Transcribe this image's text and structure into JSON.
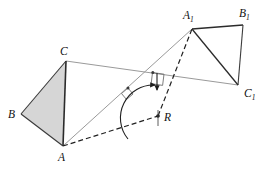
{
  "figure": {
    "background_color": "#ffffff",
    "line_color_dark": "#2b2b2b",
    "line_color_gray": "#8c8c8c",
    "fill_color_shaded": "#d4d4d4",
    "dash_color": "#1f1f1f",
    "labels": {
      "B": "B",
      "C": "C",
      "A": "A",
      "R": "R",
      "A1_base": "A",
      "A1_sub": "1",
      "B1_base": "B",
      "B1_sub": "1",
      "C1_base": "C",
      "C1_sub": "1"
    },
    "points": {
      "A": {
        "x": 63,
        "y": 146
      },
      "B": {
        "x": 21,
        "y": 114
      },
      "C": {
        "x": 66,
        "y": 61
      },
      "A1": {
        "x": 192,
        "y": 29
      },
      "B1": {
        "x": 243,
        "y": 25
      },
      "C1": {
        "x": 238,
        "y": 85
      },
      "R": {
        "x": 158,
        "y": 116
      },
      "mid_AA1": {
        "x": 128,
        "y": 88
      },
      "mid_CC1": {
        "x": 153,
        "y": 73
      }
    },
    "label_positions": {
      "A": {
        "x": 58,
        "y": 161
      },
      "B": {
        "x": 8,
        "y": 118
      },
      "C": {
        "x": 60,
        "y": 55
      },
      "R": {
        "x": 164,
        "y": 121
      },
      "A1": {
        "x": 183,
        "y": 19
      },
      "B1": {
        "x": 239,
        "y": 17
      },
      "C1": {
        "x": 244,
        "y": 97
      }
    },
    "segments": [
      {
        "name": "segment-B-C",
        "from": "B",
        "to": "C",
        "style": "solid-dark"
      },
      {
        "name": "segment-C-A",
        "from": "C",
        "to": "A",
        "style": "solid-dark"
      },
      {
        "name": "segment-A-B",
        "from": "A",
        "to": "B",
        "style": "solid-dark"
      },
      {
        "name": "segment-A1-B1",
        "from": "A1",
        "to": "B1",
        "style": "solid-dark"
      },
      {
        "name": "segment-B1-C1",
        "from": "B1",
        "to": "C1",
        "style": "solid-dark"
      },
      {
        "name": "segment-C1-A1",
        "from": "C1",
        "to": "A1",
        "style": "solid-dark"
      },
      {
        "name": "segment-A-A1",
        "from": "A",
        "to": "A1",
        "style": "solid-gray"
      },
      {
        "name": "segment-C-C1",
        "from": "C",
        "to": "C1",
        "style": "solid-gray"
      },
      {
        "name": "segment-A-R",
        "from": "A",
        "to": "R",
        "style": "dashed"
      },
      {
        "name": "segment-R-A1",
        "from": "R",
        "to": "A1",
        "style": "dashed"
      }
    ],
    "marks": {
      "right_angle_on_AA1": "perpendicular bisector mark at midpoint of A-A1",
      "right_angle_on_CC1": "perpendicular bisector mark at midpoint of C-C1",
      "rotation_arc": "arrow arc centred at R showing rotation angle",
      "tick_on_R": "short tick through R"
    }
  }
}
